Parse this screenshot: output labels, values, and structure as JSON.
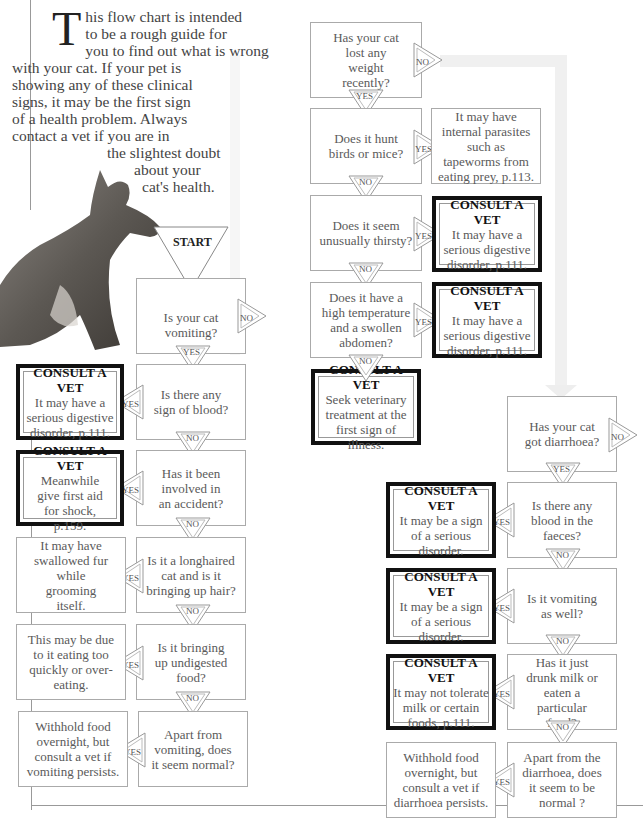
{
  "intro": {
    "dropcap": "T",
    "lines": [
      "his flow chart is intended",
      "to be a rough guide for",
      "you to find out what is wrong",
      "with your cat. If your pet is",
      "showing any of these clinical",
      "signs, it may be the first sign",
      "of a health problem. Always",
      "contact a vet if you are in",
      "the slightest doubt",
      "about your",
      "cat's health."
    ]
  },
  "labels": {
    "yes": "YES",
    "no": "NO",
    "start": "START",
    "consult": "CONSULT A VET"
  },
  "vomiting_chain": {
    "q1": "Is your cat vomiting?",
    "q2": "Is there any sign of blood?",
    "a2": "It may have a serious digestive disorder, p.111.",
    "q3": "Has it been involved in an accident?",
    "a3": "Meanwhile give first aid for shock, p.159.",
    "q4": "Is it a longhaired cat and is it bringing up hair?",
    "a4": "It may have swallowed fur while grooming itself.",
    "q5": "Is it bringing up undigested food?",
    "a5": "This may be due to it eating too quickly or over-eating.",
    "q6": "Apart from vomiting, does it seem normal?",
    "a6": "Withhold food overnight, but consult a vet if vomiting persists."
  },
  "weight_chain": {
    "q1": "Has your cat lost any weight recently?",
    "q2": "Does it hunt birds or mice?",
    "a2": "It may have internal parasites such as tapeworms from eating prey, p.113.",
    "q3": "Does it seem unusually thirsty?",
    "a3": "It may have a serious digestive disorder, p.111.",
    "q4": "Does it have a high temperature and a swollen abdomen?",
    "a4": "It may have a serious digestive disorder, p.111.",
    "a5": "Seek veterinary treatment at the first sign of illness."
  },
  "diarrhoea_chain": {
    "q1": "Has your cat got diarrhoea?",
    "q2": "Is there any blood in the faeces?",
    "a2": "It may be a sign of a serious disorder.",
    "q3": "Is it vomiting as well?",
    "a3": "It may be a sign of a serious disorder.",
    "q4": "Has it just drunk milk or eaten a particular food?",
    "a4": "It may not tolerate milk or certain foods, p.111.",
    "q5": "Apart from the diarrhoea, does it seem to be normal ?",
    "a5": "Withhold food overnight, but consult a vet if diarrhoea persists."
  }
}
